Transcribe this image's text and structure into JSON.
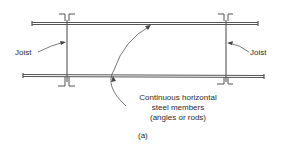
{
  "diagram": {
    "labels": {
      "joist_left": "Joist",
      "joist_right": "Joist",
      "members_line1": "Continuous horizontal",
      "members_line2": "steel members",
      "members_line3": "(angles or rods)",
      "caption": "(a)"
    },
    "colors": {
      "line": "#555555",
      "text": "#2a2a2a"
    }
  }
}
